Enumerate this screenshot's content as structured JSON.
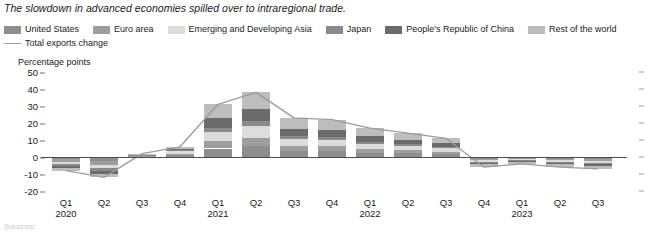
{
  "figure": {
    "title": "The slowdown in advanced economies spilled over to intraregional trade.",
    "axis_unit_label": "Percentage points",
    "footnote": "Sources:"
  },
  "legend": {
    "line_label": "Total exports change",
    "items": [
      {
        "label": "United States",
        "color": "#8e8e8e",
        "key": "united_states"
      },
      {
        "label": "Euro area",
        "color": "#9e9e9e",
        "key": "euro_area"
      },
      {
        "label": "Emerging and Developing Asia",
        "color": "#dcdcdc",
        "key": "emerging_developing_asia"
      },
      {
        "label": "Japan",
        "color": "#8a8a8a",
        "key": "japan"
      },
      {
        "label": "People's Republic of China",
        "color": "#6b6b6b",
        "key": "china"
      },
      {
        "label": "Rest of the world",
        "color": "#bdbdbd",
        "key": "rest_of_world"
      }
    ]
  },
  "chart_data": {
    "type": "bar",
    "stacked": true,
    "title": "The slowdown in advanced economies spilled over to intraregional trade.",
    "xlabel": "",
    "ylabel": "Percentage points",
    "ylim": [
      -20,
      50
    ],
    "yticks": [
      50,
      40,
      30,
      20,
      10,
      0,
      -10,
      -20
    ],
    "ytick_labels": [
      "50",
      "40",
      "30",
      "20",
      "10",
      "0",
      "-10",
      "-20"
    ],
    "grid": false,
    "legend_position": "top",
    "categories": [
      "Q1",
      "Q2",
      "Q3",
      "Q4",
      "Q1",
      "Q2",
      "Q3",
      "Q4",
      "Q1",
      "Q2",
      "Q3",
      "Q4",
      "Q1",
      "Q2",
      "Q3"
    ],
    "category_years": [
      "2020",
      "",
      "",
      "",
      "2021",
      "",
      "",
      "",
      "2022",
      "",
      "",
      "",
      "2023",
      "",
      ""
    ],
    "series": [
      {
        "name": "United States",
        "color": "#8e8e8e",
        "values": [
          -1.4,
          -2.2,
          0.4,
          1.1,
          5.0,
          6.2,
          3.6,
          3.4,
          2.6,
          2.2,
          1.8,
          -1.0,
          -0.7,
          -1.0,
          -1.2
        ]
      },
      {
        "name": "Euro area",
        "color": "#9e9e9e",
        "values": [
          -1.6,
          -2.6,
          0.3,
          0.9,
          4.2,
          5.2,
          3.0,
          2.9,
          2.2,
          1.8,
          1.4,
          -0.9,
          -0.6,
          -0.9,
          -1.0
        ]
      },
      {
        "name": "Emerging and Developing Asia",
        "color": "#dcdcdc",
        "values": [
          -1.3,
          -1.9,
          0.5,
          1.3,
          5.5,
          6.6,
          4.0,
          3.8,
          3.0,
          2.5,
          2.0,
          -0.9,
          -0.6,
          -0.9,
          -1.1
        ]
      },
      {
        "name": "Japan",
        "color": "#8a8a8a",
        "values": [
          -0.9,
          -1.3,
          0.2,
          0.6,
          2.4,
          3.0,
          1.8,
          1.7,
          1.3,
          1.1,
          0.9,
          -0.5,
          -0.4,
          -0.5,
          -0.6
        ]
      },
      {
        "name": "People's Republic of China",
        "color": "#6b6b6b",
        "values": [
          -1.5,
          -2.0,
          0.4,
          1.0,
          5.8,
          7.0,
          4.2,
          4.0,
          3.1,
          2.6,
          2.1,
          -1.0,
          -0.7,
          -1.0,
          -1.2
        ]
      },
      {
        "name": "Rest of the world",
        "color": "#bdbdbd",
        "values": [
          -1.3,
          -2.0,
          0.2,
          1.1,
          8.1,
          10.0,
          6.4,
          6.2,
          4.8,
          3.8,
          2.8,
          -1.7,
          -1.0,
          -1.7,
          -1.9
        ]
      }
    ],
    "line_series": {
      "name": "Total exports change",
      "color": "#9b9b9b",
      "values": [
        -8.0,
        -12.0,
        2.0,
        6.0,
        31.0,
        38.0,
        23.0,
        22.0,
        17.0,
        14.0,
        11.0,
        -6.0,
        -4.0,
        -6.0,
        -7.0
      ]
    }
  }
}
